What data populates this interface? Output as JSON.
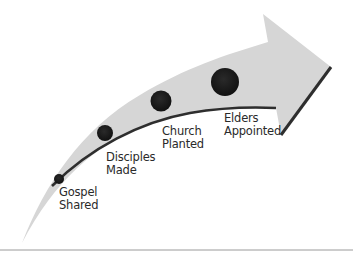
{
  "diagram": {
    "type": "curved-arrow-progression",
    "colors": {
      "arrow_fill": "#d6d6d6",
      "arrow_edge": "#333333",
      "dots": "#1a1a1a",
      "baseline": "#9a9a9a",
      "text": "#2a2a2a"
    },
    "steps": [
      {
        "line1": "Gospel",
        "line2": "Shared"
      },
      {
        "line1": "Disciples",
        "line2": "Made"
      },
      {
        "line1": "Church",
        "line2": "Planted"
      },
      {
        "line1": "Elders",
        "line2": "Appointed"
      }
    ]
  }
}
